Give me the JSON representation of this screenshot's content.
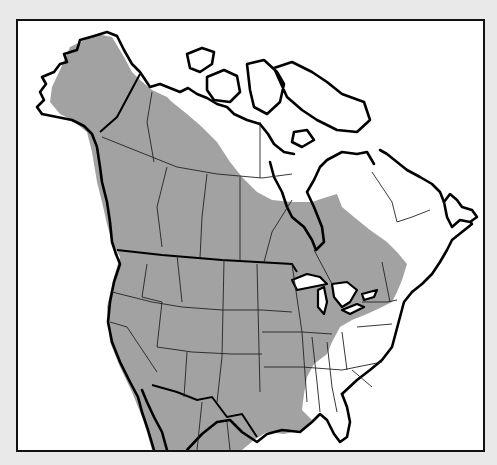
{
  "map": {
    "subject": "North America range map",
    "region": "North America",
    "legend": [],
    "colors": {
      "background": "#e9e9e9",
      "map_background": "#ffffff",
      "range_fill": "#a2a2a2",
      "outline": "#000000"
    },
    "range_description": "Shaded range covers Alaska interior, Yukon, British Columbia, Alberta, southern Canadian prairies to southern Ontario/Quebec, all western and central United States, Great Lakes region, and northern Mexico; southeastern US, Atlantic coast, and northern Canadian Arctic unshaded"
  }
}
